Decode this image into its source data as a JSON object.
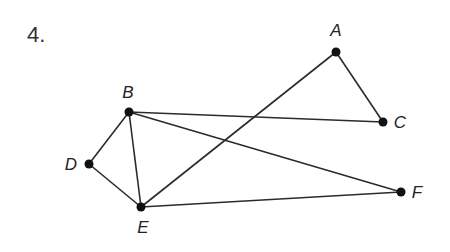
{
  "problem": {
    "number": "4."
  },
  "graph": {
    "nodes": [
      {
        "id": "A",
        "label": "A",
        "x": 336,
        "y": 52,
        "lx": 336,
        "ly": 36
      },
      {
        "id": "B",
        "label": "B",
        "x": 129,
        "y": 112,
        "lx": 128,
        "ly": 98
      },
      {
        "id": "C",
        "label": "C",
        "x": 383,
        "y": 122,
        "lx": 400,
        "ly": 128
      },
      {
        "id": "D",
        "label": "D",
        "x": 89,
        "y": 164,
        "lx": 71,
        "ly": 170
      },
      {
        "id": "E",
        "label": "E",
        "x": 141,
        "y": 207,
        "lx": 143,
        "ly": 233
      },
      {
        "id": "F",
        "label": "F",
        "x": 401,
        "y": 192,
        "lx": 417,
        "ly": 198
      }
    ],
    "edges": [
      [
        "A",
        "C"
      ],
      [
        "A",
        "E"
      ],
      [
        "B",
        "C"
      ],
      [
        "B",
        "F"
      ],
      [
        "B",
        "D"
      ],
      [
        "B",
        "E"
      ],
      [
        "D",
        "E"
      ],
      [
        "E",
        "F"
      ]
    ],
    "colors": {
      "edge": "#2b2b2b",
      "node": "#111111"
    }
  }
}
